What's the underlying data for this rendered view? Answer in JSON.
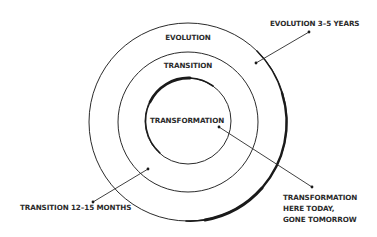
{
  "diagram": {
    "type": "concentric-circles",
    "rings": [
      {
        "id": "evolution",
        "label": "EVOLUTION",
        "radius": 99
      },
      {
        "id": "transition",
        "label": "TRANSITION",
        "radius": 70
      },
      {
        "id": "transformation",
        "label": "TRANSFORMATION",
        "radius": 43
      }
    ],
    "callouts": {
      "evolution": {
        "text": "EVOLUTION 3–5 YEARS"
      },
      "transition": {
        "text": "TRANSITION 12–15 MONTHS"
      },
      "transformation": {
        "lines": [
          "TRANSFORMATION",
          "HERE TODAY,",
          "GONE TOMORROW"
        ]
      }
    },
    "colors": {
      "stroke": "#2b2b2b",
      "text": "#2b2b2b",
      "background": "#ffffff"
    }
  }
}
